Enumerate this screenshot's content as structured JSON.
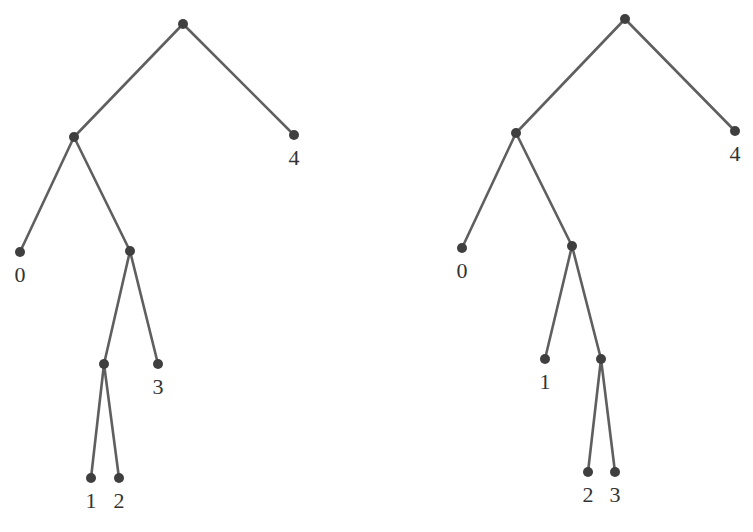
{
  "diagram": {
    "type": "binary-trees",
    "colors": {
      "edge": "#5f5f5f",
      "node": "#3f3f3f",
      "label": "#333333"
    },
    "trees": [
      {
        "name": "left-tree",
        "nodes": [
          {
            "id": "r",
            "x": 183,
            "y": 24,
            "label": ""
          },
          {
            "id": "a",
            "x": 74,
            "y": 137,
            "label": ""
          },
          {
            "id": "l4",
            "x": 294,
            "y": 135,
            "label": "4"
          },
          {
            "id": "l0",
            "x": 20,
            "y": 252,
            "label": "0"
          },
          {
            "id": "b",
            "x": 130,
            "y": 251,
            "label": ""
          },
          {
            "id": "c",
            "x": 104,
            "y": 364,
            "label": ""
          },
          {
            "id": "l3",
            "x": 158,
            "y": 364,
            "label": "3"
          },
          {
            "id": "l1",
            "x": 91,
            "y": 478,
            "label": "1"
          },
          {
            "id": "l2",
            "x": 119,
            "y": 478,
            "label": "2"
          }
        ],
        "edges": [
          [
            "r",
            "a"
          ],
          [
            "r",
            "l4"
          ],
          [
            "a",
            "l0"
          ],
          [
            "a",
            "b"
          ],
          [
            "b",
            "c"
          ],
          [
            "b",
            "l3"
          ],
          [
            "c",
            "l1"
          ],
          [
            "c",
            "l2"
          ]
        ]
      },
      {
        "name": "right-tree",
        "nodes": [
          {
            "id": "r",
            "x": 625,
            "y": 19,
            "label": ""
          },
          {
            "id": "a",
            "x": 516,
            "y": 133,
            "label": ""
          },
          {
            "id": "l4",
            "x": 735,
            "y": 131,
            "label": "4"
          },
          {
            "id": "l0",
            "x": 462,
            "y": 248,
            "label": "0"
          },
          {
            "id": "b",
            "x": 572,
            "y": 246,
            "label": ""
          },
          {
            "id": "l1",
            "x": 545,
            "y": 359,
            "label": "1"
          },
          {
            "id": "c",
            "x": 601,
            "y": 359,
            "label": ""
          },
          {
            "id": "l2",
            "x": 588,
            "y": 472,
            "label": "2"
          },
          {
            "id": "l3",
            "x": 615,
            "y": 472,
            "label": "3"
          }
        ],
        "edges": [
          [
            "r",
            "a"
          ],
          [
            "r",
            "l4"
          ],
          [
            "a",
            "l0"
          ],
          [
            "a",
            "b"
          ],
          [
            "b",
            "l1"
          ],
          [
            "b",
            "c"
          ],
          [
            "c",
            "l2"
          ],
          [
            "c",
            "l3"
          ]
        ]
      }
    ]
  }
}
